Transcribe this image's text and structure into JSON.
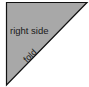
{
  "diagram": {
    "shape": "right-triangle",
    "fill_color": "#a8a8a8",
    "stroke_color": "#111111",
    "labels": {
      "face": "right side",
      "edge": "fold"
    }
  }
}
